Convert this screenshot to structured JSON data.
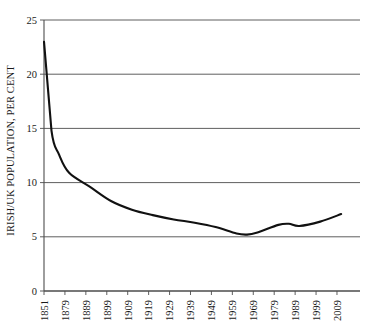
{
  "chart_data": {
    "type": "line",
    "title": "",
    "subtitle": "",
    "xlabel": "",
    "ylabel": "IRISH/UK POPULATION, PER CENT",
    "ylim": [
      0,
      25
    ],
    "yticks": [
      0,
      5,
      10,
      15,
      20,
      25
    ],
    "ytick_labels": [
      "0",
      "5",
      "10",
      "15",
      "20",
      "25"
    ],
    "grid": "horizontal",
    "legend": "none",
    "xlim": [
      1851,
      2011
    ],
    "xtick_labels": [
      "1851",
      "1879",
      "1889",
      "1899",
      "1909",
      "1919",
      "1929",
      "1939",
      "1949",
      "1959",
      "1969",
      "1979",
      "1989",
      "1999",
      "2009"
    ],
    "xtick_values": [
      1851,
      1879,
      1889,
      1899,
      1909,
      1919,
      1929,
      1939,
      1949,
      1959,
      1969,
      1979,
      1989,
      1999,
      2009
    ],
    "series": [
      {
        "name": "Irish-born share of UK population",
        "x": [
          1851,
          1861,
          1871,
          1881,
          1891,
          1901,
          1911,
          1921,
          1931,
          1941,
          1951,
          1961,
          1966,
          1971,
          1981,
          1986,
          1991,
          2001,
          2011
        ],
        "values": [
          23.0,
          14.8,
          12.6,
          10.9,
          9.6,
          8.3,
          7.5,
          7.0,
          6.6,
          6.3,
          5.9,
          5.3,
          5.2,
          5.4,
          6.1,
          6.2,
          6.0,
          6.4,
          7.1
        ]
      }
    ]
  },
  "axis": {
    "y_label_text": "IRISH/UK POPULATION, PER CENT"
  }
}
